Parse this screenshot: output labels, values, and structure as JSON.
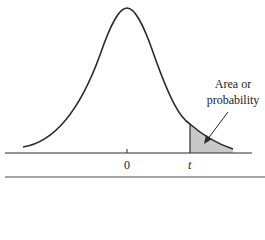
{
  "figure": {
    "type": "t-distribution right-tail area diagram",
    "annotation": {
      "line1": "Area or",
      "line2": "probability"
    },
    "x_labels": {
      "center": "0",
      "critical": "t"
    },
    "colors": {
      "curve": "#2a2a2a",
      "shade": "#c8c8c8",
      "axis": "#2a2a2a",
      "rule": "#888888"
    }
  }
}
